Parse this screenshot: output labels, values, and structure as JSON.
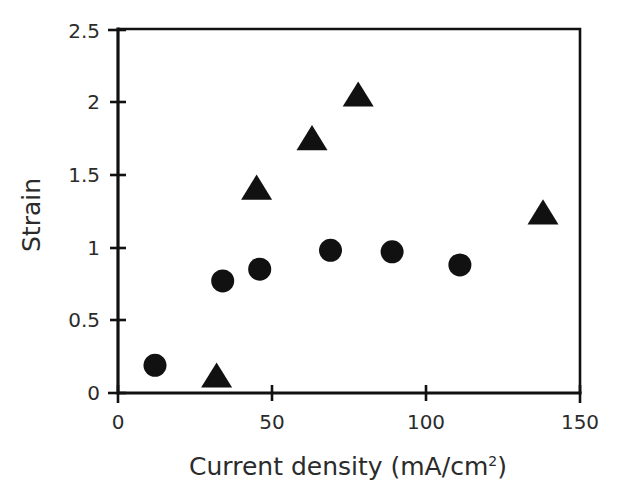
{
  "chart_data": {
    "type": "scatter",
    "title": "",
    "xlabel": "Current density (mA/cm",
    "xlabel_sup": "2",
    "xlabel_tail": ")",
    "xlabel_full": "Current density (mA/cm2)",
    "ylabel": "Strain",
    "xlim": [
      0,
      150
    ],
    "ylim": [
      0,
      2.5
    ],
    "xticks": [
      0,
      50,
      100,
      150
    ],
    "xticklabels": [
      "0",
      "50",
      "100",
      "150"
    ],
    "yticks": [
      0,
      0.5,
      1,
      1.5,
      2,
      2.5
    ],
    "yticklabels": [
      "0",
      "0.5",
      "1",
      "1.5",
      "2",
      "2.5"
    ],
    "grid": false,
    "legend": "none",
    "series": [
      {
        "name": "circles",
        "marker": "circle",
        "color": "#111111",
        "points": [
          {
            "x": 12,
            "y": 0.19
          },
          {
            "x": 34,
            "y": 0.77
          },
          {
            "x": 46,
            "y": 0.85
          },
          {
            "x": 69,
            "y": 0.98
          },
          {
            "x": 89,
            "y": 0.97
          },
          {
            "x": 111,
            "y": 0.88
          }
        ]
      },
      {
        "name": "triangles",
        "marker": "triangle",
        "color": "#111111",
        "points": [
          {
            "x": 32,
            "y": 0.11
          },
          {
            "x": 45,
            "y": 1.4
          },
          {
            "x": 63,
            "y": 1.74
          },
          {
            "x": 78,
            "y": 2.04
          },
          {
            "x": 138,
            "y": 1.23
          }
        ]
      }
    ]
  }
}
